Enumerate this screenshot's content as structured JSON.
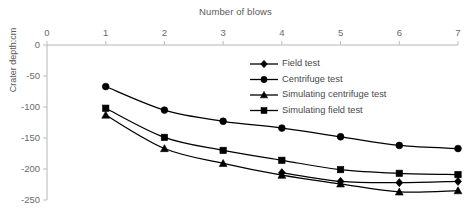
{
  "chart_data": {
    "type": "line",
    "title": "Number of blows",
    "xlabel": "Number of blows",
    "ylabel": "Crater depth:cm",
    "xlim": [
      0,
      7
    ],
    "ylim": [
      -250,
      0
    ],
    "xticks": [
      "0",
      "1",
      "2",
      "3",
      "4",
      "5",
      "6",
      "7"
    ],
    "yticks": [
      "0",
      "-50",
      "-100",
      "-150",
      "-200",
      "-250"
    ],
    "x": [
      1,
      2,
      3,
      4,
      5,
      6,
      7
    ],
    "grid": false,
    "legend_position": "upper right",
    "axis_position": "x-axis-top",
    "series": [
      {
        "name": "Field test",
        "marker": "diamond",
        "values": [
          null,
          null,
          null,
          -206,
          -220,
          -222,
          -220
        ]
      },
      {
        "name": "Centrifuge test",
        "marker": "circle",
        "values": [
          -67,
          -105,
          -123,
          -134,
          -148,
          -162,
          -167
        ]
      },
      {
        "name": "Simulating centrifuge test",
        "marker": "triangle",
        "values": [
          -113,
          -167,
          -191,
          -210,
          -224,
          -237,
          -235
        ]
      },
      {
        "name": "Simulating field test",
        "marker": "square",
        "values": [
          -102,
          -149,
          -170,
          -186,
          -201,
          -207,
          -209
        ]
      }
    ]
  },
  "legend": {
    "items": [
      {
        "label": "Field test",
        "marker": "diamond"
      },
      {
        "label": "Centrifuge test",
        "marker": "circle"
      },
      {
        "label": "Simulating centrifuge test",
        "marker": "triangle"
      },
      {
        "label": "Simulating field test",
        "marker": "square"
      }
    ]
  },
  "colors": {
    "series": "#000000",
    "axis": "#b6b6b6",
    "text": "#5a5a5a"
  }
}
